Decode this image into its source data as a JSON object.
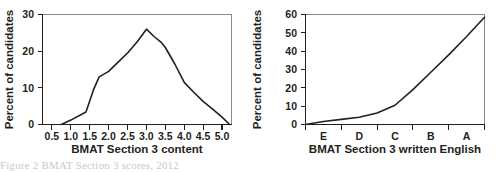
{
  "figure": {
    "caption": "Figure 2   BMAT Section 3 scores, 2012"
  },
  "chart_data": [
    {
      "id": "bmat-section-3-content",
      "type": "line",
      "title": "",
      "xlabel": "BMAT Section 3 content",
      "ylabel": "Percent of candidates",
      "xtick_labels": [
        "0.5",
        "1.0",
        "1.5",
        "2.0",
        "2.5",
        "3.0",
        "3.5",
        "4.0",
        "4.5",
        "5.0"
      ],
      "xticks": [
        0.5,
        1.0,
        1.5,
        2.0,
        2.5,
        3.0,
        3.5,
        4.0,
        4.5,
        5.0
      ],
      "ytick_labels": [
        "0",
        "10",
        "20",
        "30"
      ],
      "yticks": [
        0,
        10,
        20,
        30
      ],
      "xlim": [
        0.25,
        5.25
      ],
      "ylim": [
        0,
        30
      ],
      "grid": false,
      "legend": null,
      "x": [
        0.75,
        1.0,
        1.4,
        1.6,
        1.75,
        2.0,
        2.25,
        2.5,
        2.75,
        3.0,
        3.2,
        3.4,
        3.5,
        3.75,
        4.0,
        4.25,
        4.5,
        4.75,
        5.0,
        5.2
      ],
      "y": [
        0.0,
        1.2,
        3.4,
        9.5,
        13.0,
        14.5,
        17.0,
        19.5,
        22.5,
        26.0,
        24.0,
        22.3,
        21.0,
        16.5,
        11.5,
        8.8,
        6.3,
        4.2,
        2.0,
        0.0
      ]
    },
    {
      "id": "bmat-section-3-written-english",
      "type": "line",
      "title": "",
      "xlabel": "BMAT Section 3 written English",
      "ylabel": "Percent of candidates",
      "xtick_labels": [
        "E",
        "D",
        "C",
        "B",
        "A"
      ],
      "xticks": [
        1,
        2,
        3,
        4,
        5
      ],
      "ytick_labels": [
        "0",
        "10",
        "20",
        "30",
        "40",
        "50",
        "60"
      ],
      "yticks": [
        0,
        10,
        20,
        30,
        40,
        50,
        60
      ],
      "xlim": [
        0.5,
        5.5
      ],
      "ylim": [
        0,
        60
      ],
      "grid": false,
      "legend": null,
      "x": [
        0.5,
        1.0,
        1.5,
        2.0,
        2.5,
        3.0,
        3.5,
        4.0,
        4.5,
        5.0,
        5.5
      ],
      "y": [
        0.0,
        1.6,
        2.8,
        4.0,
        6.3,
        10.5,
        19.0,
        28.5,
        38.0,
        48.0,
        58.5
      ]
    }
  ]
}
